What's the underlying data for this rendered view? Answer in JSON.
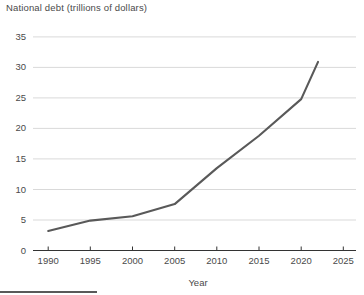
{
  "chart_data": {
    "type": "line",
    "title": "National debt (trillions of dollars)",
    "xlabel": "Year",
    "ylabel": "",
    "xlim": [
      1988.2,
      2026.5
    ],
    "ylim": [
      0,
      35.8
    ],
    "xticks": [
      1990,
      1995,
      2000,
      2005,
      2010,
      2015,
      2020,
      2025
    ],
    "yticks": [
      0,
      5,
      10,
      15,
      20,
      25,
      30,
      35
    ],
    "xtick_labels": [
      "1990",
      "1995",
      "2000",
      "2005",
      "2010",
      "2015",
      "2020",
      "2025"
    ],
    "ytick_labels": [
      "0",
      "5",
      "10",
      "15",
      "20",
      "25",
      "30",
      "35"
    ],
    "grid": "horizontal",
    "legend": "none",
    "line_color": "#595959",
    "line_width": 2.1,
    "axis_color": "#333333",
    "grid_color": "#d9d9d9",
    "text_color": "#4a4a4a",
    "x": [
      1990,
      1995,
      2000,
      2005,
      2010,
      2015,
      2020,
      2022
    ],
    "values": [
      3.2,
      4.9,
      5.6,
      7.6,
      13.5,
      18.8,
      24.8,
      30.9
    ],
    "series": [
      {
        "name": "National debt",
        "points": [
          {
            "year": 1990,
            "value": 3.2
          },
          {
            "year": 1995,
            "value": 4.9
          },
          {
            "year": 2000,
            "value": 5.6
          },
          {
            "year": 2005,
            "value": 7.6
          },
          {
            "year": 2010,
            "value": 13.5
          },
          {
            "year": 2015,
            "value": 18.8
          },
          {
            "year": 2020,
            "value": 24.8
          },
          {
            "year": 2022,
            "value": 30.9
          }
        ]
      }
    ]
  }
}
